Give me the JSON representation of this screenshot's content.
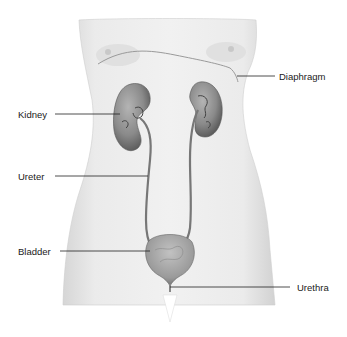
{
  "diagram": {
    "labels": [
      {
        "id": "diaphragm",
        "text": "Diaphragm",
        "x": 279,
        "y": 72
      },
      {
        "id": "kidney",
        "text": "Kidney",
        "x": 18,
        "y": 110
      },
      {
        "id": "ureter",
        "text": "Ureter",
        "x": 18,
        "y": 172
      },
      {
        "id": "bladder",
        "text": "Bladder",
        "x": 18,
        "y": 247
      },
      {
        "id": "urethra",
        "text": "Urethra",
        "x": 297,
        "y": 286
      }
    ],
    "colors": {
      "body_fill": "#ececec",
      "body_edge": "#c8c8c8",
      "organ_fill": "#8a8a8a",
      "organ_dark": "#5a5a5a",
      "leader_line": "#222222",
      "label_text": "#1a1a1a"
    }
  }
}
